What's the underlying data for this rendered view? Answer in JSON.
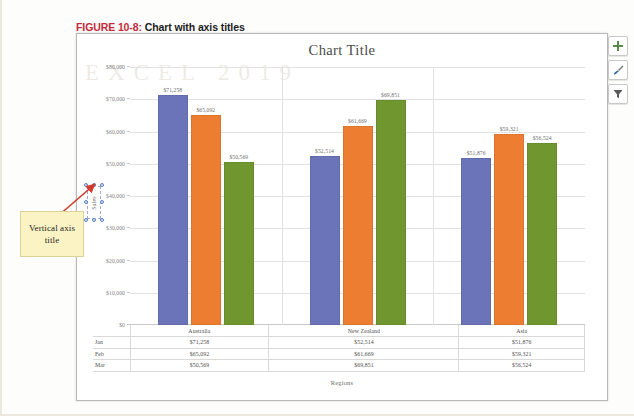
{
  "figure": {
    "number": "FIGURE 10-8:",
    "caption": "Chart with axis titles"
  },
  "ghost_text": "EXCEL 2019",
  "chart": {
    "title": "Chart Title",
    "y_axis_title": "Sales",
    "x_axis_title": "Regions",
    "y_ticks": [
      "$80,000",
      "$70,000",
      "$60,000",
      "$50,000",
      "$40,000",
      "$30,000",
      "$20,000",
      "$10,000",
      "$0"
    ]
  },
  "chart_data": {
    "type": "bar",
    "title": "Chart Title",
    "xlabel": "Regions",
    "ylabel": "Sales",
    "categories": [
      "Australia",
      "New Zealand",
      "Asia"
    ],
    "series": [
      {
        "name": "Jan",
        "color": "#6b74b8",
        "values": [
          71258,
          52514,
          51876
        ],
        "labels": [
          "$71,258",
          "$52,514",
          "$51,876"
        ]
      },
      {
        "name": "Feb",
        "color": "#ed7d31",
        "values": [
          65092,
          61669,
          59321
        ],
        "labels": [
          "$65,092",
          "$61,669",
          "$59,321"
        ]
      },
      {
        "name": "Mar",
        "color": "#70972f",
        "values": [
          50569,
          69851,
          56524
        ],
        "labels": [
          "$50,569",
          "$69,851",
          "$56,524"
        ]
      }
    ],
    "ylim": [
      0,
      80000
    ],
    "ytick_step": 10000,
    "grid": true,
    "legend": "none",
    "data_table": true,
    "data_labels": true
  },
  "data_table": {
    "column_headers": [
      "",
      "Australia",
      "New Zealand",
      "Asia"
    ],
    "rows": [
      {
        "label": "Jan",
        "cells": [
          "$71,258",
          "$52,514",
          "$51,876"
        ]
      },
      {
        "label": "Feb",
        "cells": [
          "$65,092",
          "$61,669",
          "$59,321"
        ]
      },
      {
        "label": "Mar",
        "cells": [
          "$50,569",
          "$69,851",
          "$56,524"
        ]
      }
    ]
  },
  "chart_buttons": [
    {
      "name": "chart-elements",
      "icon": "plus-icon",
      "color": "#5a8a4e"
    },
    {
      "name": "chart-styles",
      "icon": "paintbrush-icon",
      "color": "#3a6ea8"
    },
    {
      "name": "chart-filters",
      "icon": "funnel-icon",
      "color": "#595959"
    }
  ],
  "annotation": {
    "text": "Vertical axis title",
    "arrow_color": "#d23b2e",
    "box_color": "#fbf3c4"
  }
}
